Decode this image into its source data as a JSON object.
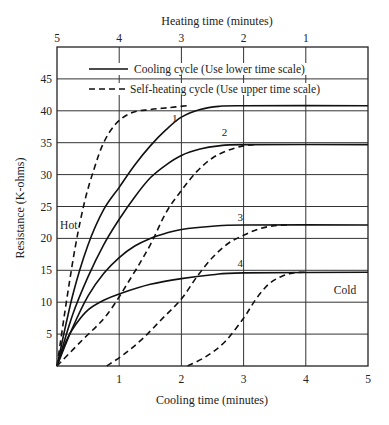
{
  "chart_data": {
    "type": "line",
    "title": "",
    "top_axis_label": "Heating time (minutes)",
    "xlabel": "Cooling time (minutes)",
    "ylabel": "Resistance (K-ohms)",
    "x_ticks_bottom": [
      "1",
      "2",
      "3",
      "4",
      "5"
    ],
    "x_ticks_top": [
      "5",
      "4",
      "3",
      "2",
      "1"
    ],
    "y_ticks": [
      "5",
      "10",
      "15",
      "20",
      "25",
      "30",
      "35",
      "40",
      "45"
    ],
    "xlim": [
      0,
      5
    ],
    "ylim": [
      0,
      50
    ],
    "grid": true,
    "legend": [
      {
        "style": "solid",
        "label": "Cooling cycle (Use lower time scale)"
      },
      {
        "style": "dashed",
        "label": "Self-heating cycle (Use upper time scale)"
      }
    ],
    "annotations": [
      {
        "text": "Hot",
        "x": 0.05,
        "y": 21.5
      },
      {
        "text": "Cold",
        "x": 4.45,
        "y": 11.3
      },
      {
        "text": "1",
        "x": 1.85,
        "y": 38.3
      },
      {
        "text": "2",
        "x": 2.65,
        "y": 36.0
      },
      {
        "text": "3",
        "x": 2.9,
        "y": 22.8
      },
      {
        "text": "4",
        "x": 2.9,
        "y": 15.5
      }
    ],
    "series": [
      {
        "name": "1",
        "style": "solid",
        "scale": "lower",
        "points": [
          [
            0,
            0
          ],
          [
            0.25,
            11
          ],
          [
            0.5,
            19
          ],
          [
            0.75,
            24.5
          ],
          [
            1,
            28
          ],
          [
            1.25,
            31.5
          ],
          [
            1.5,
            34.5
          ],
          [
            1.75,
            37
          ],
          [
            2,
            39
          ],
          [
            2.3,
            40.2
          ],
          [
            2.6,
            40.7
          ],
          [
            3,
            40.8
          ],
          [
            5,
            40.8
          ]
        ]
      },
      {
        "name": "1",
        "style": "dashed",
        "scale": "upper",
        "points": [
          [
            5,
            0
          ],
          [
            4.85,
            10
          ],
          [
            4.7,
            19
          ],
          [
            4.55,
            26
          ],
          [
            4.4,
            31
          ],
          [
            4.25,
            35
          ],
          [
            4.05,
            38
          ],
          [
            3.8,
            39.7
          ],
          [
            3.5,
            40.2
          ],
          [
            3.2,
            40.5
          ],
          [
            2.9,
            40.8
          ]
        ]
      },
      {
        "name": "2",
        "style": "solid",
        "scale": "lower",
        "points": [
          [
            0,
            0
          ],
          [
            0.25,
            8
          ],
          [
            0.5,
            14
          ],
          [
            0.75,
            19
          ],
          [
            1,
            23
          ],
          [
            1.25,
            26.5
          ],
          [
            1.5,
            29.5
          ],
          [
            1.75,
            31.5
          ],
          [
            2,
            33
          ],
          [
            2.3,
            34
          ],
          [
            2.6,
            34.5
          ],
          [
            3,
            34.7
          ],
          [
            5,
            34.7
          ]
        ]
      },
      {
        "name": "2",
        "style": "dashed",
        "scale": "upper",
        "points": [
          [
            5,
            0
          ],
          [
            4.6,
            4
          ],
          [
            4.2,
            8
          ],
          [
            3.8,
            14
          ],
          [
            3.5,
            19
          ],
          [
            3.25,
            24
          ],
          [
            3.0,
            27.5
          ],
          [
            2.75,
            30.5
          ],
          [
            2.5,
            32.6
          ],
          [
            2.25,
            33.8
          ],
          [
            2.0,
            34.5
          ],
          [
            1.8,
            34.7
          ]
        ]
      },
      {
        "name": "3",
        "style": "solid",
        "scale": "lower",
        "points": [
          [
            0,
            0
          ],
          [
            0.25,
            6
          ],
          [
            0.5,
            11
          ],
          [
            0.75,
            14.5
          ],
          [
            1,
            17
          ],
          [
            1.25,
            18.8
          ],
          [
            1.5,
            20
          ],
          [
            1.75,
            20.8
          ],
          [
            2,
            21.4
          ],
          [
            2.5,
            21.9
          ],
          [
            3,
            22.1
          ],
          [
            5,
            22.1
          ]
        ]
      },
      {
        "name": "3",
        "style": "dashed",
        "scale": "upper",
        "points": [
          [
            4.2,
            0
          ],
          [
            3.9,
            2
          ],
          [
            3.6,
            4.5
          ],
          [
            3.3,
            7.5
          ],
          [
            3.0,
            10.5
          ],
          [
            2.75,
            14
          ],
          [
            2.5,
            17
          ],
          [
            2.25,
            19.2
          ],
          [
            2.0,
            20.5
          ],
          [
            1.75,
            21.5
          ],
          [
            1.5,
            22
          ],
          [
            1.3,
            22.1
          ]
        ]
      },
      {
        "name": "4",
        "style": "solid",
        "scale": "lower",
        "points": [
          [
            0,
            0
          ],
          [
            0.15,
            4
          ],
          [
            0.3,
            6.5
          ],
          [
            0.5,
            8.8
          ],
          [
            0.75,
            10.3
          ],
          [
            1,
            11.3
          ],
          [
            1.5,
            12.8
          ],
          [
            2,
            13.7
          ],
          [
            2.5,
            14.3
          ],
          [
            3,
            14.6
          ],
          [
            5,
            14.7
          ]
        ]
      },
      {
        "name": "4",
        "style": "dashed",
        "scale": "upper",
        "points": [
          [
            2.9,
            0
          ],
          [
            2.6,
            1.5
          ],
          [
            2.3,
            3.8
          ],
          [
            2.0,
            7.5
          ],
          [
            1.8,
            10.5
          ],
          [
            1.6,
            12.8
          ],
          [
            1.4,
            14.0
          ],
          [
            1.2,
            14.6
          ],
          [
            1.0,
            14.7
          ]
        ]
      }
    ]
  }
}
